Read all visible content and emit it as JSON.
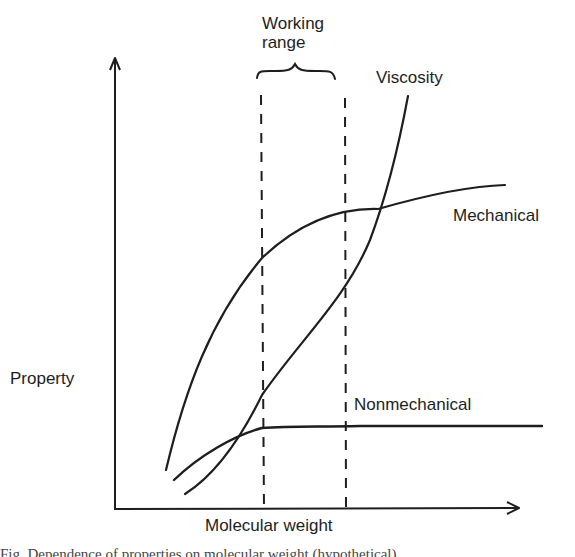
{
  "figure": {
    "annotation": {
      "line1": "Working",
      "line2": "range"
    },
    "axes": {
      "xlabel": "Molecular weight",
      "ylabel": "Property"
    },
    "curves": [
      {
        "id": "viscosity",
        "label": "Viscosity"
      },
      {
        "id": "mechanical",
        "label": "Mechanical"
      },
      {
        "id": "nonmechanical",
        "label": "Nonmechanical"
      }
    ],
    "caption_partial": "Fig. Dependence of properties on molecular weight (hypothetical)",
    "colors": {
      "ink": "#1e1e1e",
      "background": "#ffffff"
    }
  }
}
